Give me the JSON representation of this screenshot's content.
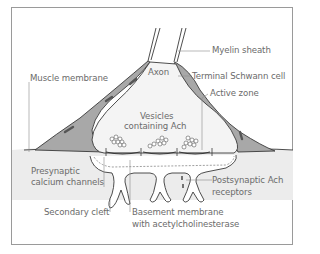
{
  "diagram": {
    "colors": {
      "frame": "#9a9a9a",
      "muscle_fill": "#ececec",
      "schwann_fill": "#a8a8a8",
      "terminal_fill": "#f4f4f4",
      "outline": "#3a3a3a",
      "label_text": "#6b6b6b",
      "leader_line": "#8a8a8a"
    },
    "labels": {
      "myelin_sheath": "Myelin sheath",
      "axon": "Axon",
      "muscle_membrane": "Muscle membrane",
      "terminal_schwann_cell": "Terminal Schwann cell",
      "active_zone": "Active zone",
      "vesicles_line1": "Vesicles",
      "vesicles_line2": "containing Ach",
      "presynaptic_line1": "Presynaptic",
      "presynaptic_line2": "calcium channels",
      "postsynaptic_line1": "Postsynaptic Ach",
      "postsynaptic_line2": "receptors",
      "secondary_cleft": "Secondary cleft",
      "basement_line1": "Basement membrane",
      "basement_line2": "with acetylcholinesterase"
    }
  }
}
